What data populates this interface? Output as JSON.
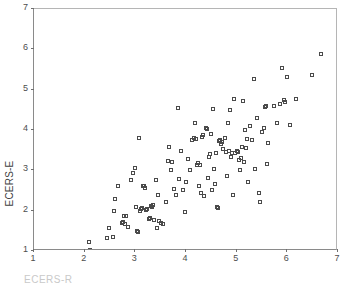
{
  "chart_data": {
    "type": "scatter",
    "title": "",
    "xlabel": "ECERS-R",
    "ylabel": "ECERS-E",
    "xlim": [
      1,
      7
    ],
    "ylim": [
      1,
      7
    ],
    "xticks": [
      1,
      2,
      3,
      4,
      5,
      6,
      7
    ],
    "yticks": [
      1,
      2,
      3,
      4,
      5,
      6,
      7
    ],
    "xticklabels": [
      "1",
      "2",
      "3",
      "4",
      "5",
      "6",
      "7"
    ],
    "yticklabels": [
      "1",
      "2",
      "3",
      "4",
      "5",
      "6",
      "7"
    ],
    "grid": false,
    "legend": null,
    "marker": "open-square",
    "marker_color": "#4a4a4a",
    "axis_color": "#8a8a8a",
    "background": "#ffffff",
    "series": [
      {
        "name": "observations",
        "points": [
          [
            2.08,
            1.22
          ],
          [
            2.1,
            1.02
          ],
          [
            2.44,
            1.32
          ],
          [
            2.49,
            1.58
          ],
          [
            2.56,
            1.35
          ],
          [
            2.58,
            2.0
          ],
          [
            2.6,
            2.29
          ],
          [
            2.66,
            2.6
          ],
          [
            2.74,
            1.7
          ],
          [
            2.76,
            1.73
          ],
          [
            2.78,
            1.86
          ],
          [
            2.8,
            1.66
          ],
          [
            2.82,
            1.88
          ],
          [
            2.85,
            1.6
          ],
          [
            2.92,
            2.77
          ],
          [
            2.96,
            2.93
          ],
          [
            3.0,
            3.05
          ],
          [
            3.02,
            2.1
          ],
          [
            3.04,
            1.5
          ],
          [
            3.06,
            1.46
          ],
          [
            3.08,
            3.81
          ],
          [
            3.1,
            1.99
          ],
          [
            3.12,
            2.04
          ],
          [
            3.14,
            2.06
          ],
          [
            3.16,
            2.6
          ],
          [
            3.18,
            2.62
          ],
          [
            3.2,
            2.57
          ],
          [
            3.22,
            2.02
          ],
          [
            3.24,
            2.05
          ],
          [
            3.26,
            1.8
          ],
          [
            3.28,
            1.82
          ],
          [
            3.3,
            2.12
          ],
          [
            3.32,
            2.1
          ],
          [
            3.34,
            2.14
          ],
          [
            3.36,
            1.78
          ],
          [
            3.4,
            2.76
          ],
          [
            3.42,
            1.58
          ],
          [
            3.44,
            2.38
          ],
          [
            3.46,
            1.74
          ],
          [
            3.5,
            1.7
          ],
          [
            3.54,
            1.66
          ],
          [
            3.6,
            2.22
          ],
          [
            3.64,
            3.22
          ],
          [
            3.66,
            3.58
          ],
          [
            3.7,
            3.02
          ],
          [
            3.72,
            3.2
          ],
          [
            3.76,
            2.54
          ],
          [
            3.8,
            2.38
          ],
          [
            3.84,
            4.54
          ],
          [
            3.86,
            2.78
          ],
          [
            3.9,
            3.49
          ],
          [
            3.94,
            2.52
          ],
          [
            3.98,
            1.97
          ],
          [
            4.0,
            2.72
          ],
          [
            4.04,
            3.28
          ],
          [
            4.08,
            3.02
          ],
          [
            4.12,
            3.74
          ],
          [
            4.16,
            3.8
          ],
          [
            4.18,
            4.17
          ],
          [
            4.2,
            3.77
          ],
          [
            4.22,
            3.12
          ],
          [
            4.24,
            3.17
          ],
          [
            4.26,
            2.62
          ],
          [
            4.28,
            3.14
          ],
          [
            4.3,
            2.43
          ],
          [
            4.32,
            3.82
          ],
          [
            4.34,
            3.88
          ],
          [
            4.36,
            2.36
          ],
          [
            4.4,
            4.06
          ],
          [
            4.42,
            4.02
          ],
          [
            4.44,
            2.8
          ],
          [
            4.46,
            3.32
          ],
          [
            4.48,
            3.4
          ],
          [
            4.5,
            3.91
          ],
          [
            4.52,
            2.52
          ],
          [
            4.54,
            4.53
          ],
          [
            4.56,
            3.04
          ],
          [
            4.58,
            2.66
          ],
          [
            4.6,
            3.44
          ],
          [
            4.62,
            2.09
          ],
          [
            4.64,
            2.07
          ],
          [
            4.66,
            3.72
          ],
          [
            4.68,
            3.76
          ],
          [
            4.7,
            3.66
          ],
          [
            4.72,
            3.7
          ],
          [
            4.74,
            3.52
          ],
          [
            4.76,
            3.8
          ],
          [
            4.78,
            3.46
          ],
          [
            4.8,
            2.86
          ],
          [
            4.82,
            4.17
          ],
          [
            4.84,
            3.48
          ],
          [
            4.86,
            4.5
          ],
          [
            4.88,
            3.34
          ],
          [
            4.9,
            3.44
          ],
          [
            4.92,
            2.4
          ],
          [
            4.94,
            4.77
          ],
          [
            4.96,
            3.42
          ],
          [
            5.0,
            3.48
          ],
          [
            5.02,
            3.46
          ],
          [
            5.04,
            3.26
          ],
          [
            5.06,
            3.02
          ],
          [
            5.08,
            3.3
          ],
          [
            5.1,
            3.58
          ],
          [
            5.12,
            4.72
          ],
          [
            5.14,
            3.2
          ],
          [
            5.16,
            4.01
          ],
          [
            5.18,
            3.55
          ],
          [
            5.2,
            3.78
          ],
          [
            5.22,
            2.7
          ],
          [
            5.26,
            4.1
          ],
          [
            5.3,
            3.74
          ],
          [
            5.34,
            5.27
          ],
          [
            5.36,
            3.03
          ],
          [
            5.4,
            4.3
          ],
          [
            5.44,
            2.44
          ],
          [
            5.46,
            2.22
          ],
          [
            5.5,
            3.96
          ],
          [
            5.54,
            4.04
          ],
          [
            5.56,
            4.58
          ],
          [
            5.58,
            4.6
          ],
          [
            5.6,
            3.16
          ],
          [
            5.62,
            3.68
          ],
          [
            5.74,
            4.6
          ],
          [
            5.8,
            4.18
          ],
          [
            5.86,
            4.64
          ],
          [
            5.9,
            5.53
          ],
          [
            5.94,
            4.74
          ],
          [
            5.96,
            4.7
          ],
          [
            6.0,
            5.32
          ],
          [
            6.06,
            4.12
          ],
          [
            6.18,
            4.77
          ],
          [
            6.48,
            5.36
          ],
          [
            6.66,
            5.88
          ]
        ]
      }
    ]
  }
}
